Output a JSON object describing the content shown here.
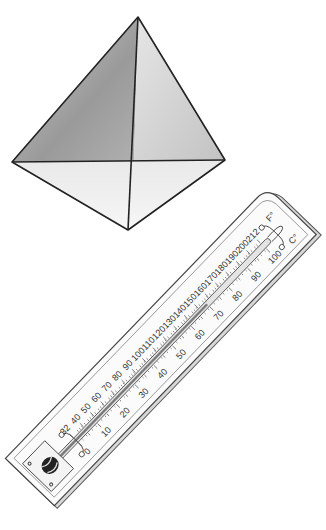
{
  "illustration": {
    "pyramid": {
      "label": "tetrahedron-pyramid",
      "apex": [
        138,
        17
      ],
      "left": [
        12,
        162
      ],
      "right": [
        225,
        160
      ],
      "bottom": [
        128,
        230
      ]
    },
    "thermometer": {
      "unit_left": "F°",
      "unit_right": "C°",
      "fahrenheit_labels": [
        "32",
        "40",
        "50",
        "60",
        "70",
        "80",
        "90",
        "100",
        "110",
        "120",
        "130",
        "140",
        "150",
        "160",
        "170",
        "180",
        "190",
        "200",
        "212"
      ],
      "celsius_labels": [
        "0",
        "10",
        "20",
        "30",
        "40",
        "50",
        "60",
        "70",
        "80",
        "90",
        "100"
      ]
    }
  }
}
